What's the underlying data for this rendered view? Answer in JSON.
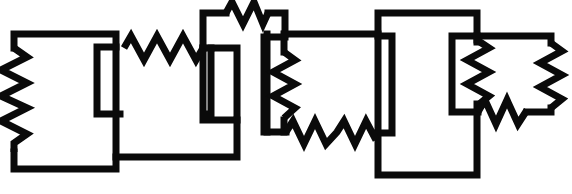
{
  "diagram": {
    "type": "electrical-circuit-schematic",
    "canvas": {
      "width": 572,
      "height": 194,
      "background": "#ffffff"
    },
    "style": {
      "line_color": "#0a0a0a",
      "line_width": 7,
      "resistor_line_width": 7,
      "fill": "none"
    },
    "blocks": [
      {
        "id": "block-1",
        "name": "left-loop",
        "box": {
          "x1": 14,
          "y1": 31,
          "x2": 116,
          "y2": 172
        },
        "resistor_count": 1
      },
      {
        "id": "block-2",
        "name": "second-loop",
        "box": {
          "x1": 97,
          "y1": 48,
          "x2": 237,
          "y2": 153
        },
        "resistor_count": 1
      },
      {
        "id": "block-3",
        "name": "top-middle-loop",
        "box": {
          "x1": 203,
          "y1": 10,
          "x2": 285,
          "y2": 120
        },
        "resistor_count": 1
      },
      {
        "id": "block-4",
        "name": "center-loop",
        "box": {
          "x1": 264,
          "y1": 34,
          "x2": 378,
          "y2": 132
        },
        "resistor_count": 2
      },
      {
        "id": "block-5",
        "name": "right-large-loop",
        "box": {
          "x1": 378,
          "y1": 13,
          "x2": 477,
          "y2": 175
        },
        "resistor_count": 0
      },
      {
        "id": "block-6",
        "name": "far-right-loop",
        "box": {
          "x1": 452,
          "y1": 33,
          "x2": 551,
          "y2": 110
        },
        "resistor_count": 3
      }
    ],
    "resistors": [
      {
        "id": "R1",
        "name": "resistor-left-vertical",
        "orientation": "vertical",
        "x": 14,
        "y_start": 48,
        "y_end": 152,
        "zigzag_peaks": 6,
        "amplitude": 13
      },
      {
        "id": "R2",
        "name": "resistor-upper-horizontal-left",
        "orientation": "horizontal",
        "y": 48,
        "x_start": 124,
        "x_end": 203,
        "zigzag_peaks": 6,
        "amplitude": 12
      },
      {
        "id": "R3",
        "name": "resistor-top-horizontal",
        "orientation": "horizontal",
        "y": 11,
        "x_start": 226,
        "x_end": 268,
        "zigzag_peaks": 4,
        "amplitude": 12
      },
      {
        "id": "R4",
        "name": "resistor-center-vertical",
        "orientation": "vertical",
        "x": 284,
        "y_start": 52,
        "y_end": 120,
        "zigzag_peaks": 5,
        "amplitude": 11
      },
      {
        "id": "R5",
        "name": "resistor-lower-horizontal-center",
        "orientation": "horizontal",
        "y": 132,
        "x_start": 286,
        "x_end": 376,
        "zigzag_peaks": 7,
        "amplitude": 12
      },
      {
        "id": "R6",
        "name": "resistor-far-right-vertical-left",
        "orientation": "vertical",
        "x": 477,
        "y_start": 40,
        "y_end": 104,
        "zigzag_peaks": 5,
        "amplitude": 11
      },
      {
        "id": "R7",
        "name": "resistor-far-right-vertical-right",
        "orientation": "vertical",
        "x": 551,
        "y_start": 43,
        "y_end": 108,
        "zigzag_peaks": 5,
        "amplitude": 11
      },
      {
        "id": "R8",
        "name": "resistor-far-right-bottom-diagonal",
        "orientation": "diagonal",
        "x_start": 478,
        "y_start": 112,
        "x_end": 527,
        "y_end": 104,
        "zigzag_peaks": 4,
        "amplitude": 12
      }
    ],
    "connections": [
      {
        "from": "block-1",
        "to": "block-2",
        "via": "R2"
      },
      {
        "from": "block-2",
        "to": "block-3",
        "via": "node"
      },
      {
        "from": "block-3",
        "to": "block-4",
        "via": "R4"
      },
      {
        "from": "block-4",
        "to": "block-5",
        "via": "R5"
      },
      {
        "from": "block-5",
        "to": "block-6",
        "via": "node"
      }
    ]
  }
}
